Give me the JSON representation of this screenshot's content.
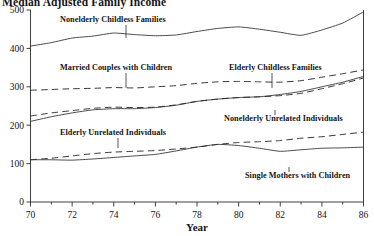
{
  "chart_data": {
    "type": "line",
    "title": "Median Adjusted Family Income",
    "xlabel": "Year",
    "ylabel": "",
    "xlim": [
      70,
      86
    ],
    "ylim": [
      0,
      500
    ],
    "xticks": [
      "70",
      "72",
      "74",
      "76",
      "78",
      "80",
      "82",
      "84",
      "86"
    ],
    "xtick_values": [
      70,
      72,
      74,
      76,
      78,
      80,
      82,
      84,
      86
    ],
    "xminor_values": [
      71,
      73,
      75,
      77,
      79,
      81,
      83,
      85
    ],
    "yticks": [
      "0",
      "100",
      "200",
      "300",
      "400",
      "500"
    ],
    "ytick_values": [
      0,
      100,
      200,
      300,
      400,
      500
    ],
    "grid": false,
    "legend_position": "inline-annotations",
    "x": [
      70,
      71,
      72,
      73,
      74,
      75,
      76,
      77,
      78,
      79,
      80,
      81,
      82,
      83,
      84,
      85,
      86
    ],
    "series": [
      {
        "name": "Nonelderly Childless Families",
        "style": "solid",
        "values": [
          406,
          415,
          427,
          432,
          440,
          436,
          433,
          435,
          444,
          452,
          456,
          450,
          442,
          434,
          448,
          466,
          495
        ]
      },
      {
        "name": "Married Couples with Children",
        "style": "dashed",
        "values": [
          291,
          293,
          295,
          296,
          298,
          297,
          300,
          303,
          309,
          313,
          314,
          313,
          312,
          316,
          325,
          334,
          344
        ]
      },
      {
        "name": "Elderly Childless Families",
        "style": "dashed",
        "values": [
          224,
          232,
          238,
          244,
          247,
          246,
          247,
          253,
          262,
          268,
          272,
          274,
          277,
          283,
          295,
          308,
          323
        ]
      },
      {
        "name": "Nonelderly Unrelated Individuals",
        "style": "solid",
        "values": [
          210,
          222,
          232,
          240,
          243,
          243,
          246,
          252,
          262,
          268,
          272,
          274,
          280,
          288,
          300,
          312,
          327
        ]
      },
      {
        "name": "Elderly Unrelated Individuals",
        "style": "dashed",
        "values": [
          110,
          114,
          120,
          126,
          130,
          132,
          134,
          138,
          143,
          150,
          155,
          157,
          160,
          166,
          170,
          176,
          182
        ]
      },
      {
        "name": "Single Mothers with Children",
        "style": "solid",
        "values": [
          110,
          110,
          109,
          112,
          116,
          120,
          124,
          133,
          143,
          150,
          147,
          140,
          132,
          136,
          140,
          141,
          143
        ]
      }
    ],
    "annotations": [
      {
        "text": "Nonelderly Childless Families",
        "label_x": 60,
        "label_y": 22,
        "leader_from_x": 126,
        "leader_from_y": 25,
        "leader_to_x": 126,
        "leader_to_y": 38
      },
      {
        "text": "Married Couples with Children",
        "label_x": 60,
        "label_y": 70,
        "leader_from_x": 126,
        "leader_from_y": 73,
        "leader_to_x": 126,
        "leader_to_y": 88
      },
      {
        "text": "Elderly Childless Families",
        "label_x": 229,
        "label_y": 70,
        "leader_from_x": 272,
        "leader_from_y": 73,
        "leader_to_x": 272,
        "leader_to_y": 88
      },
      {
        "text": "Nonelderly Unrelated Individuals",
        "label_x": 224,
        "label_y": 121,
        "leader_from_x": 275,
        "leader_from_y": 110,
        "leader_to_x": 275,
        "leader_to_y": 115
      },
      {
        "text": "Elderly Unrelated Individuals",
        "label_x": 60,
        "label_y": 135,
        "leader_from_x": 118,
        "leader_from_y": 138,
        "leader_to_x": 118,
        "leader_to_y": 148
      },
      {
        "text": "Single Mothers with Children",
        "label_x": 245,
        "label_y": 178,
        "leader_from_x": 289,
        "leader_from_y": 167,
        "leader_to_x": 289,
        "leader_to_y": 172
      }
    ]
  }
}
